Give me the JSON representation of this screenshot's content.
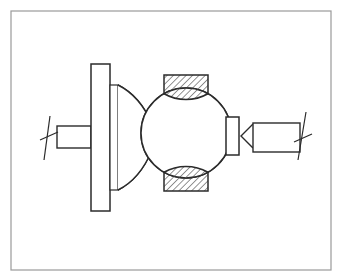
{
  "document": {
    "kind": "engineering-drawing",
    "subject": "Ball valve / spherical joint sectional assembly drawing",
    "projection": "sectional elevation",
    "background_color": "#ffffff",
    "line_color": "#2b2b2b",
    "frame_color": "#9a9a9a",
    "hatch_color": "#3a3a3a",
    "fill_color": "#ffffff",
    "labels": [],
    "annotations": [],
    "dimensions": []
  },
  "canvas": {
    "width": 341,
    "height": 280
  },
  "frame": {
    "x": 11,
    "y": 11,
    "width": 320,
    "height": 259,
    "stroke_width": 1.2
  },
  "parts": {
    "left_shaft": {
      "name": "left shaft",
      "x": 57,
      "y": 126,
      "width": 34,
      "height": 22,
      "stroke_width": 1.4
    },
    "left_break_line": {
      "name": "left shaft break line",
      "top_x": 50,
      "top_y": 116,
      "bottom_x": 44,
      "bottom_y": 160,
      "tick_x1": 40,
      "tick_y1": 140,
      "tick_x2": 58,
      "tick_y2": 132
    },
    "flange_plate": {
      "name": "flange plate",
      "x": 91,
      "y": 64,
      "width": 19,
      "height": 147,
      "stroke_width": 1.5
    },
    "flange_hub": {
      "name": "flange hub",
      "x": 110,
      "y": 85,
      "width": 8,
      "height": 105,
      "stroke_width": 1.2
    },
    "neck_upper": {
      "name": "upper concave neck",
      "start_x": 118,
      "start_y": 85,
      "ctrl_x": 140,
      "ctrl_y": 96,
      "end_x": 152,
      "end_y": 124
    },
    "neck_lower": {
      "name": "lower concave neck",
      "start_x": 118,
      "start_y": 190,
      "ctrl_x": 140,
      "ctrl_y": 179,
      "end_x": 152,
      "end_y": 150
    },
    "sphere": {
      "name": "spherical ball body",
      "cx": 186,
      "cy": 133,
      "r": 45,
      "stroke_width": 1.5
    },
    "upper_seat_block": {
      "name": "upper hatched seat block",
      "x": 164,
      "y": 75,
      "width": 44,
      "height": 17,
      "hatch_angle": 45,
      "hatch_spacing": 3.2
    },
    "lower_seat_block": {
      "name": "lower hatched seat block",
      "x": 164,
      "y": 174,
      "width": 44,
      "height": 17,
      "hatch_angle": 45,
      "hatch_spacing": 3.2
    },
    "right_collar": {
      "name": "right collar / gland",
      "x": 226,
      "y": 117,
      "width": 13,
      "height": 38,
      "stroke_width": 1.5
    },
    "vee_wedge": {
      "name": "vee wedge connector",
      "apex_x": 241,
      "apex_y": 136,
      "top_x": 253,
      "top_y": 124,
      "bottom_x": 253,
      "bottom_y": 148
    },
    "right_shaft": {
      "name": "right shaft",
      "x": 253,
      "y": 123,
      "width": 47,
      "height": 29,
      "stroke_width": 1.4
    },
    "right_break_line": {
      "name": "right shaft break line",
      "top_x": 306,
      "top_y": 112,
      "bottom_x": 298,
      "bottom_y": 160,
      "tick_x1": 294,
      "tick_y1": 142,
      "tick_x2": 312,
      "tick_y2": 134
    }
  }
}
